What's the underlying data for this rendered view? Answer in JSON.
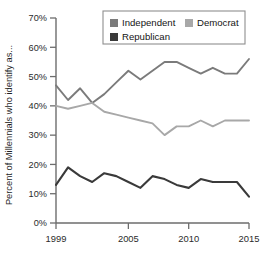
{
  "chart_data": {
    "type": "line",
    "title": "",
    "xlabel": "",
    "ylabel": "Percent of Millennials who identify as...",
    "xlim": [
      1999,
      2015
    ],
    "ylim": [
      0,
      70
    ],
    "grid": false,
    "legend_position": "top-center",
    "x": [
      1999,
      2000,
      2001,
      2002,
      2003,
      2004,
      2005,
      2006,
      2007,
      2008,
      2009,
      2010,
      2011,
      2012,
      2013,
      2014,
      2015
    ],
    "ytick_labels": [
      "0%",
      "10%",
      "20%",
      "30%",
      "40%",
      "50%",
      "60%",
      "70%"
    ],
    "ytick_values": [
      0,
      10,
      20,
      30,
      40,
      50,
      60,
      70
    ],
    "xtick_labels": [
      "1999",
      "2005",
      "2010",
      "2015"
    ],
    "xtick_values": [
      1999,
      2005,
      2010,
      2015
    ],
    "series": [
      {
        "name": "Independent",
        "color": "#7b7b7b",
        "values": [
          47,
          42,
          46,
          41,
          44,
          48,
          52,
          49,
          52,
          55,
          55,
          53,
          51,
          53,
          51,
          51,
          56
        ]
      },
      {
        "name": "Democrat",
        "color": "#a8a8a8",
        "values": [
          40,
          39,
          40,
          41,
          38,
          37,
          36,
          35,
          34,
          30,
          33,
          33,
          35,
          33,
          35,
          35,
          35
        ]
      },
      {
        "name": "Republican",
        "color": "#3a3a3a",
        "values": [
          13,
          19,
          16,
          14,
          17,
          16,
          14,
          12,
          16,
          15,
          13,
          12,
          15,
          14,
          14,
          14,
          9
        ]
      }
    ]
  },
  "legend": {
    "entries": [
      {
        "label": "Independent",
        "color": "#7b7b7b",
        "swatch_name": "legend-swatch-independent"
      },
      {
        "label": "Democrat",
        "color": "#a8a8a8",
        "swatch_name": "legend-swatch-democrat"
      },
      {
        "label": "Republican",
        "color": "#3a3a3a",
        "swatch_name": "legend-swatch-republican"
      }
    ]
  },
  "colors": {
    "axis": "#6d6d6d",
    "text": "#1a1a1a",
    "background": "#ffffff",
    "legend_border": "#8f8f8f"
  }
}
